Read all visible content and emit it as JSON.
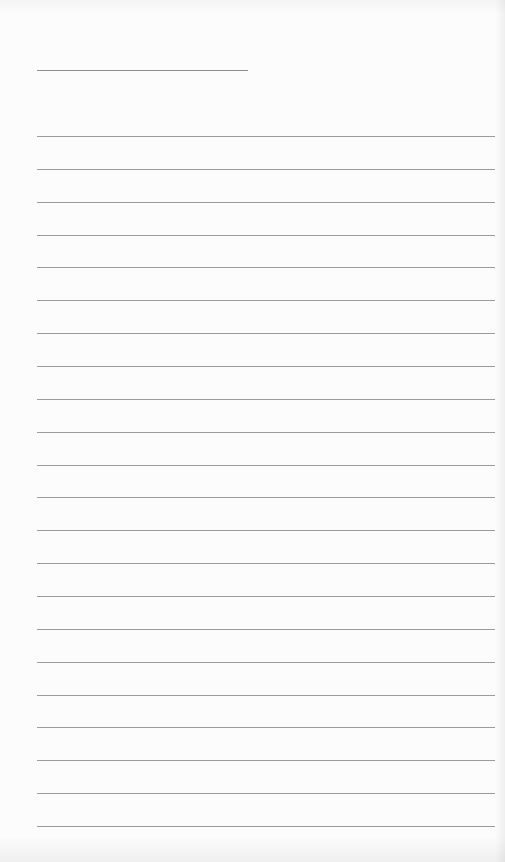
{
  "document": {
    "type": "blank lined paper",
    "title_line": {
      "x": 37,
      "y": 70,
      "width": 211,
      "color": "#8f8f8f"
    },
    "ruled_lines": {
      "count": 22,
      "first_y": 136,
      "last_y": 826,
      "left": 37,
      "width": 458,
      "color": "#9c9c9c"
    },
    "text_content": []
  }
}
